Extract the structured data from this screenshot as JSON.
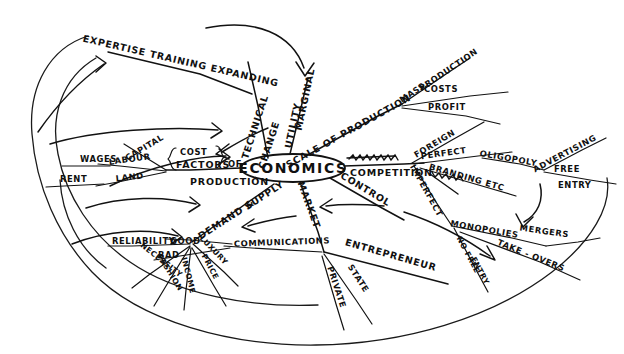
{
  "document": {
    "kind": "hand-drawn-mind-map",
    "subject": "Economics",
    "ink_color": "#121212",
    "background_color": "#ffffff"
  },
  "center": {
    "label": "ECONOMICS"
  },
  "branches": {
    "expertise": {
      "label": "EXPERTISE TRAINING EXPANDING"
    },
    "technical_change": {
      "label": "TECHNICAL"
    },
    "technical_change_2": {
      "label": "CHANGE"
    },
    "marginal": {
      "label": "MARGINAL"
    },
    "utility": {
      "label": "UTILITY"
    },
    "scale": {
      "label": "SCALE OF PRODUCTION"
    },
    "mass": {
      "label": "MASS"
    },
    "production": {
      "label": "PRODUCTION"
    },
    "costs": {
      "label": "COSTS"
    },
    "profit": {
      "label": "PROFIT"
    },
    "competition": {
      "label": "COMPETITION"
    },
    "competition_struck": {
      "label": ""
    },
    "foreign": {
      "label": "FOREIGN"
    },
    "perfect": {
      "label": "PERFECT"
    },
    "imperfect": {
      "label": "IMPERFECT"
    },
    "imperfect_struck": {
      "label": ""
    },
    "oligopoly": {
      "label": "OLIGOPOLY"
    },
    "branding": {
      "label": "BRANDING ETC"
    },
    "advertising": {
      "label": "ADVERTISING"
    },
    "free": {
      "label": "FREE"
    },
    "entry": {
      "label": "ENTRY"
    },
    "monopolies": {
      "label": "MONOPOLIES"
    },
    "mergers": {
      "label": "MERGERS"
    },
    "takeovers": {
      "label": "TAKE - OVERS"
    },
    "no_free": {
      "label": "NO FREE"
    },
    "no_entry": {
      "label": "ENTRY"
    },
    "control": {
      "label": "CONTROL"
    },
    "market": {
      "label": "MARKET"
    },
    "entrepreneur": {
      "label": "ENTREPRENEUR"
    },
    "state": {
      "label": "STATE"
    },
    "private": {
      "label": "PRIVATE"
    },
    "communications": {
      "label": "COMMUNICATIONS"
    },
    "good": {
      "label": "GOOD"
    },
    "bad": {
      "label": "BAD"
    },
    "demand": {
      "label": "DEMAND &"
    },
    "supply": {
      "label": "SUPPLY"
    },
    "reliability": {
      "label": "RELIABILITY"
    },
    "necessity": {
      "label": "NECESSITY"
    },
    "fashion": {
      "label": "FASHION"
    },
    "income": {
      "label": "INCOME"
    },
    "luxury": {
      "label": "LUXURY"
    },
    "price": {
      "label": "PRICE"
    },
    "cost": {
      "label": "COST"
    },
    "factors": {
      "label": "FACTORS"
    },
    "of": {
      "label": "OF"
    },
    "production_factors": {
      "label": "PRODUCTION"
    },
    "capital": {
      "label": "CAPITAL"
    },
    "labour": {
      "label": "LABOUR"
    },
    "wages": {
      "label": "WAGES"
    },
    "land": {
      "label": "LAND"
    },
    "rent": {
      "label": "RENT"
    }
  }
}
